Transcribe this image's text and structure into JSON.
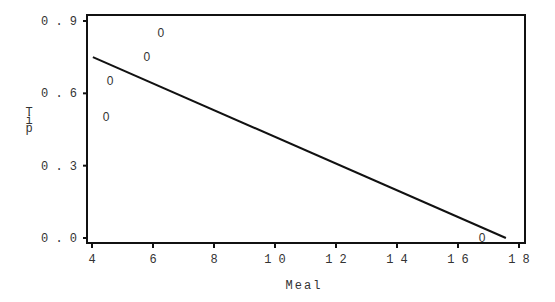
{
  "chart_data": {
    "type": "scatter",
    "title": "",
    "xlabel": "Meal",
    "ylabel": "Tip",
    "xlim": [
      4,
      18
    ],
    "ylim": [
      0.0,
      0.9
    ],
    "xticks": [
      4,
      6,
      8,
      10,
      12,
      14,
      16,
      18
    ],
    "xtick_labels": [
      "4",
      "6",
      "8",
      "10",
      "12",
      "14",
      "16",
      "18"
    ],
    "yticks": [
      0.0,
      0.3,
      0.6,
      0.9
    ],
    "ytick_labels": [
      "0.0",
      "0.3",
      "0.6",
      "0.9"
    ],
    "grid": false,
    "legend": null,
    "marker": "0",
    "series": [
      {
        "name": "observations",
        "points": [
          {
            "x": 4.46,
            "y": 0.5
          },
          {
            "x": 4.59,
            "y": 0.65
          },
          {
            "x": 5.8,
            "y": 0.75
          },
          {
            "x": 6.26,
            "y": 0.85
          },
          {
            "x": 16.79,
            "y": 0.0
          }
        ]
      }
    ],
    "fit_line": {
      "name": "regression line",
      "x": [
        4.03,
        17.57
      ],
      "y": [
        0.75,
        0.0
      ]
    }
  }
}
